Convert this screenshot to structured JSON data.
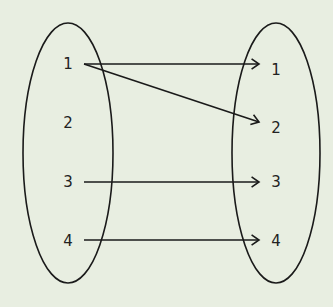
{
  "diagram": {
    "type": "mapping",
    "background": "#e8eee1",
    "stroke": "#1a1a1a",
    "domain_set": {
      "ellipse": {
        "cx": 68,
        "cy": 153,
        "rx": 45,
        "ry": 130
      },
      "elements": [
        {
          "label": "1",
          "x": 68,
          "y": 69
        },
        {
          "label": "2",
          "x": 68,
          "y": 128
        },
        {
          "label": "3",
          "x": 68,
          "y": 187
        },
        {
          "label": "4",
          "x": 68,
          "y": 246
        }
      ]
    },
    "codomain_set": {
      "ellipse": {
        "cx": 276,
        "cy": 153,
        "rx": 44,
        "ry": 130
      },
      "elements": [
        {
          "label": "1",
          "x": 276,
          "y": 75
        },
        {
          "label": "2",
          "x": 276,
          "y": 133
        },
        {
          "label": "3",
          "x": 276,
          "y": 187
        },
        {
          "label": "4",
          "x": 276,
          "y": 246
        }
      ]
    },
    "arrows": [
      {
        "from": "1",
        "to": "1",
        "x1": 84,
        "y1": 64,
        "x2": 259,
        "y2": 64
      },
      {
        "from": "1",
        "to": "2",
        "x1": 84,
        "y1": 64,
        "x2": 259,
        "y2": 122
      },
      {
        "from": "3",
        "to": "3",
        "x1": 84,
        "y1": 182,
        "x2": 259,
        "y2": 182
      },
      {
        "from": "4",
        "to": "4",
        "x1": 84,
        "y1": 240,
        "x2": 259,
        "y2": 240
      }
    ]
  }
}
